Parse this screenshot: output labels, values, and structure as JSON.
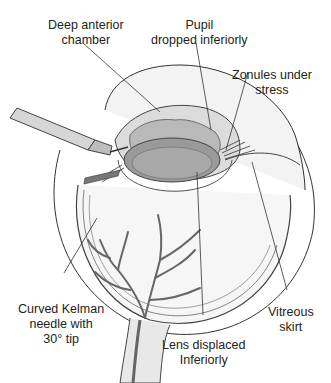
{
  "figure": {
    "labels": {
      "deep_anterior_chamber": {
        "line1": "Deep anterior",
        "line2": "chamber"
      },
      "pupil_dropped": {
        "line1": "Pupil",
        "line2": "dropped inferiorly"
      },
      "zonules_stress": {
        "line1": "Zonules under",
        "line2": "stress"
      },
      "kelman_needle": {
        "line1": "Curved Kelman",
        "line2": "needle with",
        "line3": "30° tip"
      },
      "lens_displaced": {
        "line1": "Lens displaced",
        "line2": "Inferiorly"
      },
      "vitreous_skirt": {
        "line1": "Vitreous",
        "line2": "skirt"
      }
    },
    "colors": {
      "line": "#333333",
      "vessel": "#666666",
      "lens_gray": "#9a9a9a",
      "iris_gray": "#c8c8c8",
      "fill_light": "#eeeeee"
    }
  }
}
